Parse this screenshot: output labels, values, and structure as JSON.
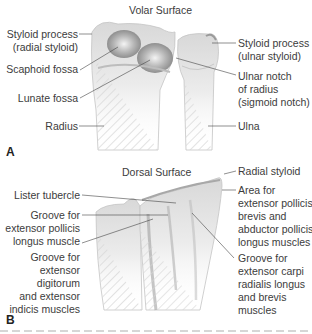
{
  "panel_a": {
    "title": "Volar Surface",
    "letter": "A",
    "labels": {
      "radial_styloid_1": "Styloid process",
      "radial_styloid_2": "(radial styloid)",
      "scaphoid_fossa": "Scaphoid fossa",
      "lunate_fossa": "Lunate fossa",
      "radius": "Radius",
      "ulnar_styloid_1": "Styloid process",
      "ulnar_styloid_2": "(ulnar styloid)",
      "ulnar_notch_1": "Ulnar notch",
      "ulnar_notch_2": "of radius",
      "ulnar_notch_3": "(sigmoid notch)",
      "ulna": "Ulna"
    }
  },
  "panel_b": {
    "title": "Dorsal Surface",
    "letter": "B",
    "labels": {
      "lister": "Lister tubercle",
      "epl_1": "Groove for",
      "epl_2": "extensor pollicis",
      "epl_3": "longus muscle",
      "edc_1": "Groove for",
      "edc_2": "extensor",
      "edc_3": "digitorum",
      "edc_4": "and extensor",
      "edc_5": "indicis muscles",
      "radial_styloid": "Radial styloid",
      "epb_1": "Area for",
      "epb_2": "extensor pollicis",
      "epb_3": "brevis and",
      "epb_4": "abductor pollicis",
      "epb_5": "longus muscles",
      "ecr_1": "Groove for",
      "ecr_2": "extensor carpi",
      "ecr_3": "radialis longus",
      "ecr_4": "and brevis",
      "ecr_5": "muscles"
    }
  },
  "colors": {
    "bone_light": "#f2f2f2",
    "bone_shade": "#9a9a9a",
    "leader_line": "#444444",
    "text": "#3c3c3c"
  }
}
